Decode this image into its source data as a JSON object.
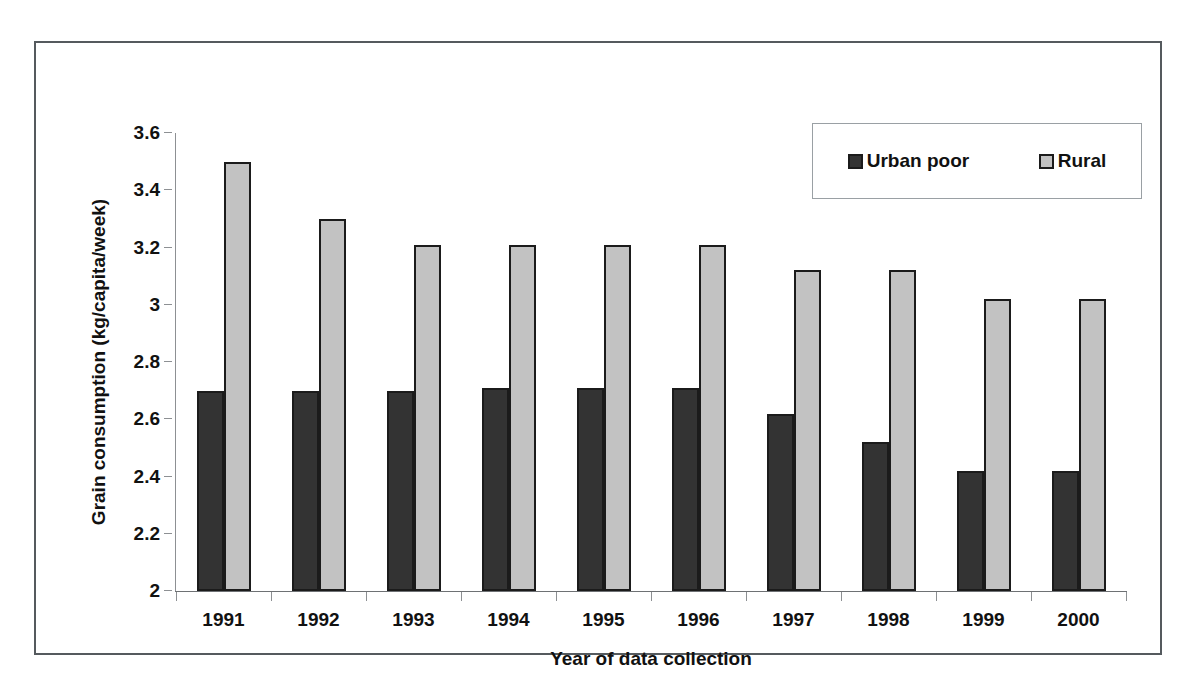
{
  "chart_data": {
    "type": "bar",
    "title": "",
    "xlabel": "Year of data collection",
    "ylabel": "Grain consumption (kg/capita/week)",
    "categories": [
      "1991",
      "1992",
      "1993",
      "1994",
      "1995",
      "1996",
      "1997",
      "1998",
      "1999",
      "2000"
    ],
    "series": [
      {
        "name": "Urban poor",
        "color": "#333333",
        "values": [
          2.7,
          2.7,
          2.7,
          2.71,
          2.71,
          2.71,
          2.62,
          2.52,
          2.42,
          2.42
        ]
      },
      {
        "name": "Rural",
        "color": "#c2c2c2",
        "values": [
          3.5,
          3.3,
          3.21,
          3.21,
          3.21,
          3.21,
          3.12,
          3.12,
          3.02,
          3.02
        ]
      }
    ],
    "ylim": [
      2,
      3.6
    ],
    "yticks": [
      "2",
      "2.2",
      "2.4",
      "2.6",
      "2.8",
      "3",
      "3.2",
      "3.4",
      "3.6"
    ],
    "ytick_values": [
      2,
      2.2,
      2.4,
      2.6,
      2.8,
      3,
      3.2,
      3.4,
      3.6
    ],
    "grid": false,
    "legend_position": "top-right",
    "legend_entries": [
      "Urban poor",
      "Rural"
    ]
  },
  "figure": {
    "border_color": "#555a5e",
    "background": "#ffffff"
  }
}
